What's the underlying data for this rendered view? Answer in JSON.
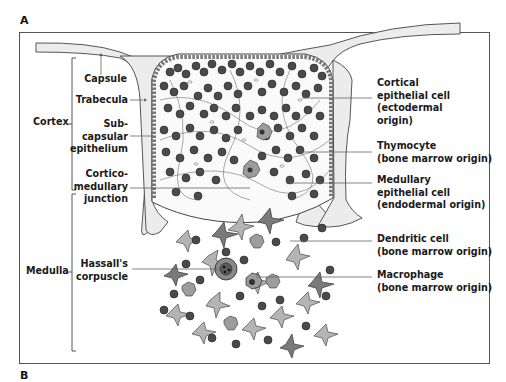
{
  "panel_labels": {
    "top": "A",
    "bottom": "B"
  },
  "regions": {
    "cortex": "Cortex",
    "medulla": "Medulla"
  },
  "left_labels": {
    "capsule": [
      "Capsule"
    ],
    "trabecula": [
      "Trabecula"
    ],
    "subcapsular": [
      "Sub-",
      "capsular",
      "epithelium"
    ],
    "corticomedullary": [
      "Cortico-",
      "medullary",
      "junction"
    ],
    "hassalls": [
      "Hassall's",
      "corpuscle"
    ]
  },
  "right_labels": {
    "cortical_epithelial": [
      "Cortical",
      "epithelial cell",
      "(ectodermal",
      "origin)"
    ],
    "thymocyte": [
      "Thymocyte",
      "(bone marrow origin)"
    ],
    "medullary_epithelial": [
      "Medullary",
      "epithelial cell",
      "(endodermal origin)"
    ],
    "dendritic": [
      "Dendritic cell",
      "(bone marrow origin)"
    ],
    "macrophage": [
      "Macrophage",
      "(bone marrow origin)"
    ]
  },
  "colors": {
    "capsule_fill": "#ececec",
    "thymocyte_dark": "#444444",
    "thymocyte_ring": "#9a9a9a",
    "epithelial_gray": "#b4b4b4",
    "dendritic_dark": "#7a7a7a",
    "outline": "#333333"
  }
}
